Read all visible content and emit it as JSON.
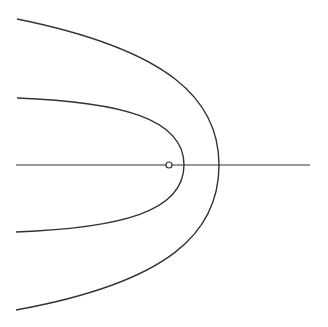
{
  "diagram": {
    "stroke_color": "#333333",
    "background": "#ffffff",
    "axis": {
      "x1": 16,
      "y1": 165,
      "x2": 310,
      "y2": 165
    },
    "focus": {
      "cx": 169,
      "cy": 165,
      "r": 3
    },
    "curves": [
      {
        "name": "inner-parabola",
        "path": "M17,98 C120,102 184,118 184,165 C184,212 120,228 16,232"
      },
      {
        "name": "outer-parabola",
        "path": "M17,19 C170,50 219,100 219,165 C219,232 170,282 16,310"
      }
    ]
  }
}
